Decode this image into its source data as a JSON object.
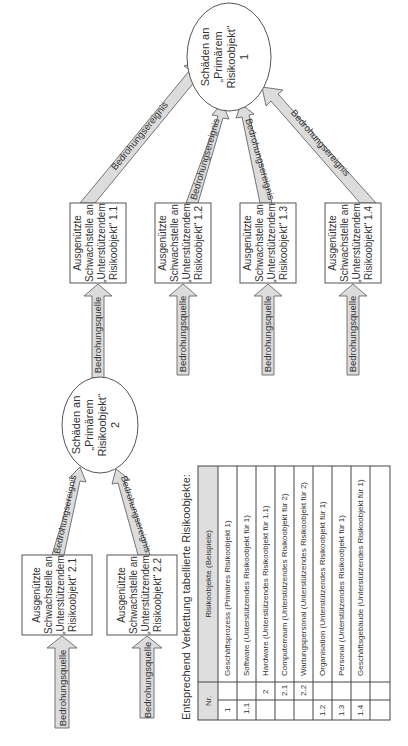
{
  "diagram": {
    "orientation": "rotated-90-ccw",
    "primary_objects": [
      {
        "id": "1",
        "lines": [
          "Schäden an",
          "„Primärem",
          "Risikoobjekt“",
          "1"
        ]
      },
      {
        "id": "2",
        "lines": [
          "Schäden an",
          "„Primärem",
          "Risikoobjekt“",
          "2"
        ]
      }
    ],
    "supporting_objects": [
      {
        "id": "1.1",
        "lines": [
          "Ausgenützte",
          "Schwachstelle an",
          "„Unterstützendem",
          "Risikoobjekt“ 1.1"
        ]
      },
      {
        "id": "1.2",
        "lines": [
          "Ausgenützte",
          "Schwachstelle an",
          "„Unterstützendem",
          "Risikoobjekt“ 1.2"
        ]
      },
      {
        "id": "1.3",
        "lines": [
          "Ausgenützte",
          "Schwachstelle an",
          "„Unterstützendem",
          "Risikoobjekt“ 1.3"
        ]
      },
      {
        "id": "1.4",
        "lines": [
          "Ausgenützte",
          "Schwachstelle an",
          "„Unterstützendem",
          "Risikoobjekt“ 1.4"
        ]
      },
      {
        "id": "2.1",
        "lines": [
          "Ausgenützte",
          "Schwachstelle an",
          "„Unterstützendem",
          "Risikoobjekt“ 2.1"
        ]
      },
      {
        "id": "2.2",
        "lines": [
          "Ausgenützte",
          "Schwachstelle an",
          "„Unterstützendem",
          "Risikoobjekt“ 2.2"
        ]
      }
    ],
    "arrow_labels": {
      "event": "Bedrohungsereignis",
      "source": "Bedrohungsquelle"
    }
  },
  "table": {
    "caption": "Entsprechend Verkettung tabellierte Risikoobjekte:",
    "headers": {
      "nr": "Nr.",
      "objects": "Risikoobjekte (Beispiele)"
    },
    "rows": [
      {
        "nr1": "1",
        "nr2": "",
        "label": "Geschäftsprozess (Primäres Risikoobjekt 1)"
      },
      {
        "nr1": "1.1",
        "nr2": "",
        "label": "Software (Unterstützendes Risikoobjekt für 1)"
      },
      {
        "nr1": "",
        "nr2": "2",
        "label": "Hardware (Unterstützendes Risikoobjekt für 1.1)"
      },
      {
        "nr1": "",
        "nr2": "2.1",
        "label": "Computerraum (Unterstützendes Risikoobjekt für 2)"
      },
      {
        "nr1": "",
        "nr2": "2.2",
        "label": "Wartungspersonal (Unterstützendes Risikoobjekt für 2)"
      },
      {
        "nr1": "1.2",
        "nr2": "",
        "label": "Organisation (Unterstützendes Risikoobjekt für 1)"
      },
      {
        "nr1": "1.3",
        "nr2": "",
        "label": "Personal (Unterstützendes Risikoobjekt für 1)"
      },
      {
        "nr1": "1.4",
        "nr2": "",
        "label": "Geschäftsgebäude (Unterstützendes Risikoobjekt für 1)"
      },
      {
        "nr1": "",
        "nr2": "",
        "label": ""
      }
    ]
  }
}
